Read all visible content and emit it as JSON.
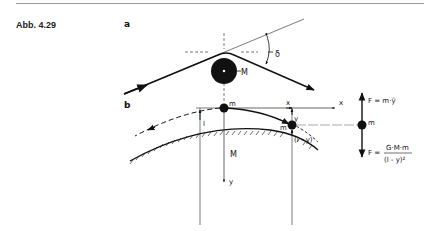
{
  "figure": {
    "label": "Abb. 4.29",
    "panels": {
      "a": {
        "label": "a",
        "mass_label": "M",
        "angle_label": "δ"
      },
      "b": {
        "label": "b",
        "small_mass_label": "m",
        "small_mass_label_2": "m",
        "planet_label": "M",
        "x_axis_label": "x",
        "x_position_label": "x",
        "y_axis_label": "y",
        "y_offset_label": "y",
        "height_label": "l",
        "distance_label": "(l - y)"
      }
    },
    "force_diagram": {
      "mass_label": "m",
      "upward_force": "F = m·ÿ",
      "downward_force_prefix": "F =",
      "downward_force_numerator": "G·M·m",
      "downward_force_denominator": "(l - y)²"
    }
  }
}
